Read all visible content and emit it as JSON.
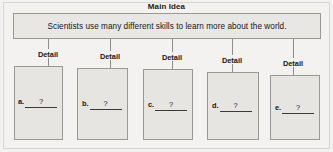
{
  "worksheet": {
    "title": "Main Idea",
    "main_idea": {
      "text": "Scientists use many different skills to learn more about the world."
    },
    "detail_label": "Detail",
    "details": [
      {
        "letter": "a.",
        "answer": "?"
      },
      {
        "letter": "b.",
        "answer": "?"
      },
      {
        "letter": "c.",
        "answer": "?"
      },
      {
        "letter": "d.",
        "answer": "?"
      },
      {
        "letter": "e.",
        "answer": "?"
      }
    ],
    "colors": {
      "box_fill": "#e9e7e4",
      "box_border": "#9a9894",
      "page_background": "#f4f2f0",
      "text": "#161616"
    }
  }
}
